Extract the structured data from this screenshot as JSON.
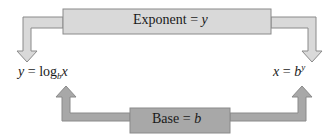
{
  "diagram": {
    "top_box": {
      "label": "Exponent",
      "eq": "=",
      "var": "y"
    },
    "bottom_box": {
      "label": "Base",
      "eq": "=",
      "var": "b"
    },
    "left_formula": {
      "lhs": "y",
      "eq": "=",
      "fn": "log",
      "base": "b",
      "arg": "x"
    },
    "right_formula": {
      "lhs": "x",
      "eq": "=",
      "base": "b",
      "exp": "y"
    },
    "colors": {
      "top_fill": "#d9d9d9",
      "bottom_fill": "#a8a8a8",
      "stroke": "#8a8a8a",
      "text": "#1a1a1a"
    }
  }
}
